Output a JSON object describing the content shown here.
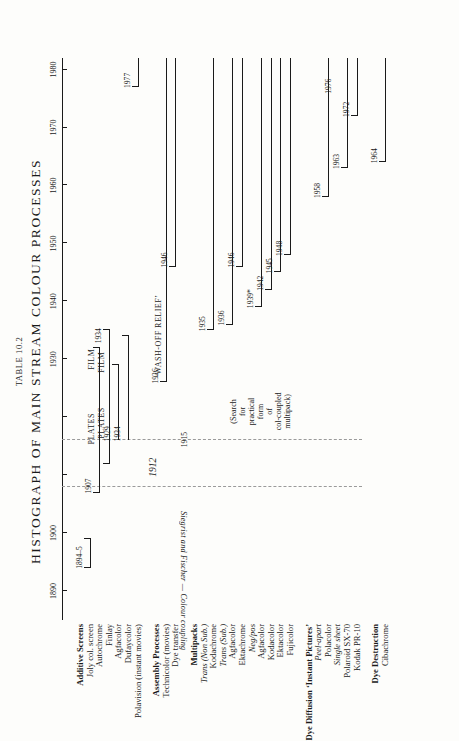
{
  "figure": {
    "table_number": "Table 10.2",
    "title": "HISTOGRAPH OF MAIN STREAM COLOUR PROCESSES"
  },
  "axis": {
    "label": "",
    "min": 1885,
    "max": 1982,
    "ticks": [
      1890,
      1900,
      1910,
      1920,
      1930,
      1940,
      1950,
      1960,
      1970,
      1980
    ],
    "tick_labels": [
      "1890",
      "1900",
      "1910",
      "1920",
      "1930",
      "1940",
      "1950",
      "1960",
      "1970",
      "1980"
    ],
    "visible_tick_labels": [
      "1890",
      "1900",
      "1930",
      "1940",
      "1950",
      "1960",
      "1970",
      "1980"
    ]
  },
  "band": {
    "start": 1908,
    "end": 1916,
    "year": "1912",
    "label": "Siegrist and Fischer — Colour coupling"
  },
  "annotations": {
    "search_note": "(Search\nfor\npractical\nform\nof\ncol-coupled\nmultipack)",
    "wash_off_relief": "‘WASH-OFF RELIEF’",
    "plates": "PLATES",
    "film": "FILM"
  },
  "groups": [
    {
      "name": "Additive Screens",
      "rows": [
        {
          "label": "Joly col. screen",
          "style": "plain",
          "start": 1894,
          "end": 1899,
          "start_year": "1894–5",
          "end_year": "",
          "start_cap": true,
          "end_cap": true
        },
        {
          "label": "Autochrome",
          "style": "plain",
          "start": 1907,
          "end": 1932,
          "start_year": "1907",
          "end_year": "",
          "start_cap": true,
          "end_cap": true,
          "segments": [
            {
              "text": "PLATES",
              "at": 1918
            },
            {
              "text": "FILM",
              "at": 1930
            }
          ]
        },
        {
          "label": "Finlay",
          "style": "plain",
          "start": 1912,
          "end": 1935,
          "start_year": "",
          "end_year": "1934",
          "start_cap": true,
          "end_cap": true,
          "segments": [
            {
              "text": "PLATES",
              "at": 1919
            },
            {
              "text": "FILM",
              "at": 1929.5
            }
          ]
        },
        {
          "label": "Agfacolor",
          "style": "plain",
          "start": 1916,
          "end": 1929,
          "start_year": "1929",
          "end_year": "",
          "start_cap": false,
          "end_cap": true
        },
        {
          "label": "Dufaycolor",
          "style": "plain",
          "start": 1916,
          "end": 1934,
          "start_year": "1934",
          "end_year": "",
          "start_cap": false,
          "end_cap": true
        },
        {
          "label": "Polavision (instant movies)",
          "style": "plain",
          "start": 1977,
          "end": 1982,
          "start_year": "1977",
          "end_year": "",
          "start_cap": true,
          "end_cap": false
        }
      ]
    },
    {
      "name": "Assembly Processes",
      "rows": [
        {
          "label": "Technicolor (movies)",
          "style": "plain",
          "start": 1926,
          "end": 1982,
          "start_year": "1926",
          "end_year": "",
          "start_cap": true,
          "end_cap": false,
          "segments": [
            {
              "text": "‘WASH-OFF RELIEF’",
              "at": 1934
            }
          ]
        },
        {
          "label": "Dye transfer",
          "style": "plain",
          "start": 1946,
          "end": 1982,
          "start_year": "1946",
          "end_year": "",
          "start_cap": true,
          "end_cap": false
        }
      ]
    },
    {
      "name": "Multipacks",
      "rows": [
        {
          "label": "Trans (Non Sub.)",
          "style": "italic-head",
          "start": null,
          "end": null
        },
        {
          "label": "Kodachrome",
          "style": "plain",
          "start": 1935,
          "end": 1982,
          "start_year": "1935",
          "end_year": "",
          "start_cap": true,
          "end_cap": false
        },
        {
          "label": "Trans (Sub.)",
          "style": "italic-head",
          "start": null,
          "end": null
        },
        {
          "label": "Agfacolor",
          "style": "plain",
          "start": 1936,
          "end": 1982,
          "start_year": "1936",
          "end_year": "",
          "start_cap": true,
          "end_cap": false
        },
        {
          "label": "Ektachrome",
          "style": "plain",
          "start": 1946,
          "end": 1982,
          "start_year": "1946",
          "end_year": "",
          "start_cap": true,
          "end_cap": false
        },
        {
          "label": "Neg/pos",
          "style": "italic-head",
          "start": null,
          "end": null
        },
        {
          "label": "Agfacolor",
          "style": "plain",
          "start": 1939,
          "end": 1982,
          "start_year": "1939*",
          "end_year": "",
          "start_cap": true,
          "end_cap": false
        },
        {
          "label": "Kodacolor",
          "style": "plain",
          "start": 1942,
          "end": 1982,
          "start_year": "1942",
          "end_year": "",
          "start_cap": true,
          "end_cap": false
        },
        {
          "label": "Ektacolor",
          "style": "plain",
          "start": 1945,
          "end": 1982,
          "start_year": "1945",
          "end_year": "",
          "start_cap": true,
          "end_cap": false
        },
        {
          "label": "Fujicolor",
          "style": "plain",
          "start": 1948,
          "end": 1982,
          "start_year": "1948",
          "end_year": "",
          "start_cap": true,
          "end_cap": false
        }
      ]
    },
    {
      "name": "Dye Diffusion ‘Instant Pictures’",
      "rows": [
        {
          "label": "Peel-apart",
          "style": "italic-head",
          "start": null,
          "end": null
        },
        {
          "label": "Polacolor",
          "style": "plain",
          "start": 1958,
          "end": 1982,
          "start_year": "1958",
          "end_year": "",
          "start_cap": true,
          "end_cap": false
        },
        {
          "label": "Single sheet",
          "style": "italic-head",
          "start": null,
          "end": null
        },
        {
          "label": "Polaroid SX-70",
          "style": "plain",
          "start": 1963,
          "end": 1982,
          "start_year": "1963",
          "end_year": "",
          "start_cap": true,
          "end_cap": false
        },
        {
          "label": "Kodak PR-10",
          "style": "plain",
          "start": 1972,
          "end": 1982,
          "start_year": "1972",
          "end_year": "",
          "start_cap": true,
          "end_cap": false
        }
      ]
    },
    {
      "name": "Dye Destruction",
      "rows": [
        {
          "label": "Cibachrome",
          "style": "plain",
          "start": 1964,
          "end": 1982,
          "start_year": "1964",
          "end_year": "",
          "start_cap": true,
          "end_cap": false
        }
      ]
    }
  ],
  "extra_markers": [
    {
      "year": "1915",
      "value": 1915
    },
    {
      "year": "1976",
      "value": 1976
    }
  ],
  "chart_data": {
    "type": "bar",
    "orientation": "horizontal-timeline",
    "title": "HISTOGRAPH OF MAIN STREAM COLOUR PROCESSES",
    "subtitle": "Table 10.2",
    "xlabel": "Year",
    "ylabel": "Process",
    "xlim": [
      1885,
      1982
    ],
    "grid": false,
    "legend": "none",
    "categories": [
      "Joly col. screen",
      "Autochrome",
      "Finlay",
      "Agfacolor (additive)",
      "Dufaycolor",
      "Polavision (instant movies)",
      "Technicolor (movies)",
      "Dye transfer",
      "Kodachrome",
      "Agfacolor (trans sub.)",
      "Ektachrome",
      "Agfacolor (neg/pos)",
      "Kodacolor",
      "Ektacolor",
      "Fujicolor",
      "Polacolor",
      "Polaroid SX-70",
      "Kodak PR-10",
      "Cibachrome"
    ],
    "spans": [
      {
        "name": "Joly col. screen",
        "start": 1894,
        "end": 1899
      },
      {
        "name": "Autochrome",
        "start": 1907,
        "end": 1932
      },
      {
        "name": "Finlay",
        "start": 1912,
        "end": 1935
      },
      {
        "name": "Agfacolor (additive)",
        "start": 1916,
        "end": 1929
      },
      {
        "name": "Dufaycolor",
        "start": 1916,
        "end": 1934
      },
      {
        "name": "Polavision (instant movies)",
        "start": 1977,
        "end": 1982
      },
      {
        "name": "Technicolor (movies)",
        "start": 1926,
        "end": 1982
      },
      {
        "name": "Dye transfer",
        "start": 1946,
        "end": 1982
      },
      {
        "name": "Kodachrome",
        "start": 1935,
        "end": 1982
      },
      {
        "name": "Agfacolor (trans sub.)",
        "start": 1936,
        "end": 1982
      },
      {
        "name": "Ektachrome",
        "start": 1946,
        "end": 1982
      },
      {
        "name": "Agfacolor (neg/pos)",
        "start": 1939,
        "end": 1982
      },
      {
        "name": "Kodacolor",
        "start": 1942,
        "end": 1982
      },
      {
        "name": "Ektacolor",
        "start": 1945,
        "end": 1982
      },
      {
        "name": "Fujicolor",
        "start": 1948,
        "end": 1982
      },
      {
        "name": "Polacolor",
        "start": 1958,
        "end": 1982
      },
      {
        "name": "Polaroid SX-70",
        "start": 1963,
        "end": 1982
      },
      {
        "name": "Kodak PR-10",
        "start": 1972,
        "end": 1982
      },
      {
        "name": "Cibachrome",
        "start": 1964,
        "end": 1982
      }
    ]
  }
}
